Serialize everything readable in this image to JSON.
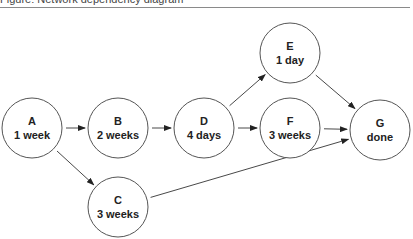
{
  "caption": {
    "text": "Figure: Network dependency diagram"
  },
  "nodes": [
    {
      "id": "A",
      "label": "A",
      "duration": "1 week",
      "cx": 32,
      "cy": 128
    },
    {
      "id": "B",
      "label": "B",
      "duration": "2 weeks",
      "cx": 118,
      "cy": 128
    },
    {
      "id": "C",
      "label": "C",
      "duration": "3 weeks",
      "cx": 118,
      "cy": 207
    },
    {
      "id": "D",
      "label": "D",
      "duration": "4 days",
      "cx": 204,
      "cy": 128
    },
    {
      "id": "E",
      "label": "E",
      "duration": "1 day",
      "cx": 290,
      "cy": 53
    },
    {
      "id": "F",
      "label": "F",
      "duration": "3 weeks",
      "cx": 290,
      "cy": 128
    },
    {
      "id": "G",
      "label": "G",
      "duration": "done",
      "cx": 380,
      "cy": 130
    }
  ],
  "edges": [
    {
      "from": "A",
      "to": "B"
    },
    {
      "from": "A",
      "to": "C"
    },
    {
      "from": "B",
      "to": "D"
    },
    {
      "from": "D",
      "to": "E"
    },
    {
      "from": "D",
      "to": "F"
    },
    {
      "from": "E",
      "to": "G"
    },
    {
      "from": "F",
      "to": "G"
    },
    {
      "from": "C",
      "to": "G"
    }
  ],
  "colors": {
    "stroke": "#555555",
    "text": "#222222",
    "rule": "#8a8a8a"
  }
}
